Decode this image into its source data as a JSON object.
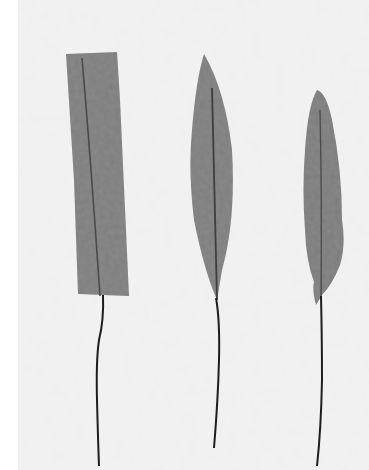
{
  "image": {
    "description": "Grayscale photograph of three paper/fabric leaf-shaped pieces mounted on thin wire stems against a mottled light gray background",
    "background_color": "#f2f2f2",
    "margin_color": "#ffffff",
    "leaf_color": "#7e7e7e",
    "vein_color": "#4a4a4a",
    "stem_color": "#222222",
    "objects": [
      {
        "name": "rectangular-leaf",
        "shape": "rectangle"
      },
      {
        "name": "lanceolate-leaf",
        "shape": "pointed-lanceolate"
      },
      {
        "name": "elliptic-leaf",
        "shape": "narrow-elliptic"
      }
    ]
  }
}
